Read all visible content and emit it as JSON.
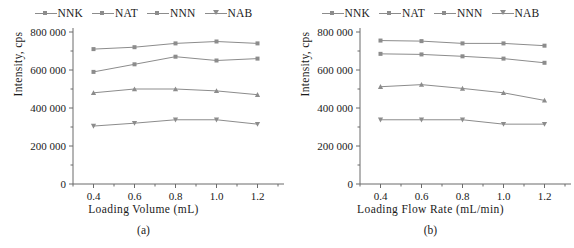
{
  "figure": {
    "axis_color": "#6b6b6b",
    "series_color": "#8c8c8c"
  },
  "chart_data": [
    {
      "type": "line",
      "panel": "a",
      "title": "",
      "xlabel": "Loading Volume (mL)",
      "ylabel": "Intensity, cps",
      "caption": "(a)",
      "x": [
        0.4,
        0.6,
        0.8,
        1.0,
        1.2
      ],
      "xticklabels": [
        "0.4",
        "0.6",
        "0.8",
        "1.0",
        "1.2"
      ],
      "xlim": [
        0.3,
        1.3
      ],
      "ylim": [
        0,
        800000
      ],
      "yticks": [
        0,
        200000,
        400000,
        600000,
        800000
      ],
      "yticklabels": [
        "0",
        "200 000",
        "400 000",
        "600 000",
        "800 000"
      ],
      "grid": false,
      "legend_position": "top-center",
      "series": [
        {
          "name": "NNK",
          "marker": "square",
          "values": [
            710000,
            720000,
            740000,
            750000,
            740000
          ]
        },
        {
          "name": "NAT",
          "marker": "square",
          "values": [
            590000,
            630000,
            670000,
            650000,
            660000
          ]
        },
        {
          "name": "NNN",
          "marker": "triangle",
          "values": [
            480000,
            500000,
            500000,
            490000,
            470000
          ]
        },
        {
          "name": "NAB",
          "marker": "triangle-down",
          "values": [
            305000,
            320000,
            338000,
            338000,
            315000
          ]
        }
      ]
    },
    {
      "type": "line",
      "panel": "b",
      "title": "",
      "xlabel": "Loading Flow Rate (mL/min)",
      "ylabel": "Intensity, cps",
      "caption": "(b)",
      "x": [
        0.4,
        0.6,
        0.8,
        1.0,
        1.2
      ],
      "xticklabels": [
        "0.4",
        "0.6",
        "0.8",
        "1.0",
        "1.2"
      ],
      "xlim": [
        0.3,
        1.3
      ],
      "ylim": [
        0,
        800000
      ],
      "yticks": [
        0,
        200000,
        400000,
        600000,
        800000
      ],
      "yticklabels": [
        "0",
        "200 000",
        "400 000",
        "600 000",
        "800 000"
      ],
      "grid": false,
      "legend_position": "top-center",
      "series": [
        {
          "name": "NNK",
          "marker": "square",
          "values": [
            755000,
            752000,
            740000,
            740000,
            728000
          ]
        },
        {
          "name": "NAT",
          "marker": "square",
          "values": [
            685000,
            682000,
            672000,
            660000,
            638000
          ]
        },
        {
          "name": "NNN",
          "marker": "triangle",
          "values": [
            512000,
            523000,
            503000,
            480000,
            440000
          ]
        },
        {
          "name": "NAB",
          "marker": "triangle-down",
          "values": [
            338000,
            338000,
            338000,
            315000,
            315000
          ]
        }
      ]
    }
  ],
  "legend": {
    "entries": [
      {
        "label": "NNK"
      },
      {
        "label": "NAT"
      },
      {
        "label": "NNN"
      },
      {
        "label": "NAB"
      }
    ]
  }
}
